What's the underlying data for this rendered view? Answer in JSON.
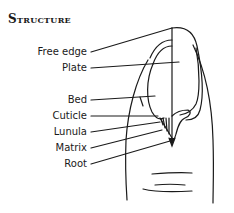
{
  "title": "Structure",
  "labels": [
    {
      "id": "free-edge",
      "text": "Free edge"
    },
    {
      "id": "plate",
      "text": "Plate"
    },
    {
      "id": "bed",
      "text": "Bed"
    },
    {
      "id": "cuticle",
      "text": "Cuticle"
    },
    {
      "id": "lunula",
      "text": "Lunula"
    },
    {
      "id": "matrix",
      "text": "Matrix"
    },
    {
      "id": "root",
      "text": "Root"
    }
  ],
  "colors": {
    "ink": "#1a1a1a",
    "background": "#ffffff"
  }
}
